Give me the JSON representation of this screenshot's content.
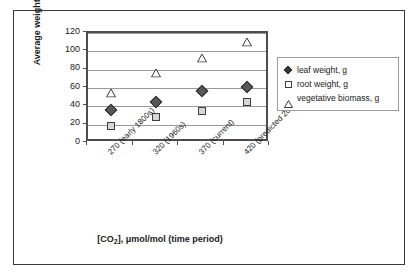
{
  "chart_data": {
    "type": "scatter",
    "title": "",
    "xlabel": "[CO2], μmol/mol (time period)",
    "ylabel": "Average weight, g",
    "categories": [
      "270 (early 1800s)",
      "320 (1960s)",
      "370 (current)",
      "420 (predicted 2020)"
    ],
    "series": [
      {
        "name": "leaf weight, g",
        "marker": "diamond",
        "color": "#585858",
        "values": [
          36,
          45,
          57,
          61
        ]
      },
      {
        "name": "root weight, g",
        "marker": "square",
        "color": "#d6d6d6",
        "values": [
          19,
          28,
          35,
          45
        ]
      },
      {
        "name": "vegetative biomass, g",
        "marker": "triangle",
        "color": "#ffffff",
        "values": [
          55,
          76,
          93,
          110
        ]
      }
    ],
    "ylim": [
      0,
      120
    ],
    "yticks": [
      0,
      20,
      40,
      60,
      80,
      100,
      120
    ],
    "ytick_labels": [
      "0",
      "20",
      "40",
      "60",
      "80",
      "100",
      "120"
    ],
    "grid": true,
    "legend_position": "right"
  },
  "axis": {
    "y_title": "Average weight, g",
    "x_title_prefix": "[CO",
    "x_title_sub": "2",
    "x_title_suffix": "], μmol/mol (time period)"
  },
  "legend": {
    "items": [
      {
        "label": "leaf weight, g",
        "icon": "filled-diamond-icon"
      },
      {
        "label": "root weight, g",
        "icon": "open-square-icon"
      },
      {
        "label": "vegetative biomass, g",
        "icon": "open-triangle-icon"
      }
    ]
  }
}
